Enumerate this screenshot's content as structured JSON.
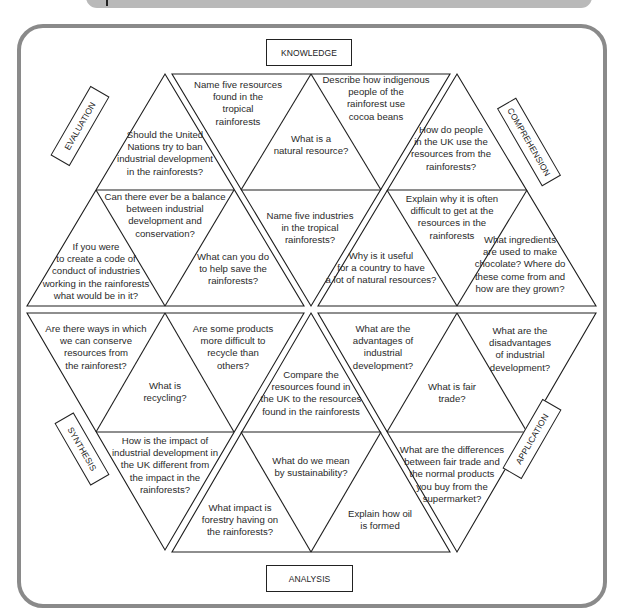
{
  "diagram": {
    "type": "hexagonal question grid (Bloom's taxonomy, rainforest topic)",
    "labels": {
      "top": "KNOWLEDGE",
      "right_upper": "COMPREHENSION",
      "right_lower": "APPLICATION",
      "bottom": "ANALYSIS",
      "left_lower": "SYNTHESIS",
      "left_upper": "EVALUATION"
    },
    "knowledge": {
      "q1": "Name five resources\nfound in the\ntropical\nrainforests",
      "q2": "What is a\nnatural resource?",
      "q3": "Describe how indigenous\npeople of the\nrainforest use\ncocoa beans",
      "q4": "Name five industries\nin the tropical\nrainforests?"
    },
    "comprehension": {
      "q1": "How do people\nin the UK use the\nresources from the\nrainforests?",
      "q2": "Explain why it is often\ndifficult to get at the\nresources in the\nrainforests",
      "q3": "Why is it useful\nfor a country to have\na lot of natural resources?",
      "q4": "What ingredients\nare used to make\nchocolate? Where do\nthese come from and\nhow are they grown?"
    },
    "evaluation": {
      "q1": "Should the United\nNations try to ban\nindustrial development\nin the rainforests?",
      "q2": "Can there ever be a balance\nbetween industrial\ndevelopment and\nconservation?",
      "q3": "If you were\nto create a code of\nconduct of industries\nworking in the rainforests\nwhat would be in it?",
      "q4": "What can you do\nto help save the\nrainforests?"
    },
    "synthesis": {
      "q1": "Are there ways in which\nwe can conserve\nresources from\nthe rainforest?",
      "q2": "What is\nrecycling?",
      "q3": "Are some products\nmore difficult to\nrecycle than\nothers?",
      "q4": "How is the impact of\nindustrial development in\nthe UK different from\nthe impact in the\nrainforests?"
    },
    "analysis": {
      "q1": "Compare the\nresources found in\nthe UK to the resources\nfound in the rainforests",
      "q2": "What do we mean\nby sustainability?",
      "q3": "What impact is\nforestry having on\nthe rainforests?",
      "q4": "Explain how oil\nis formed"
    },
    "application": {
      "q1": "What are the\nadvantages of\nindustrial\ndevelopment?",
      "q2": "What is fair\ntrade?",
      "q3": "What are the\ndisadvantages\nof industrial\ndevelopment?",
      "q4": "What are the differences\nbetween fair trade and\nthe normal products\nyou buy from the\nsupermarket?"
    }
  }
}
